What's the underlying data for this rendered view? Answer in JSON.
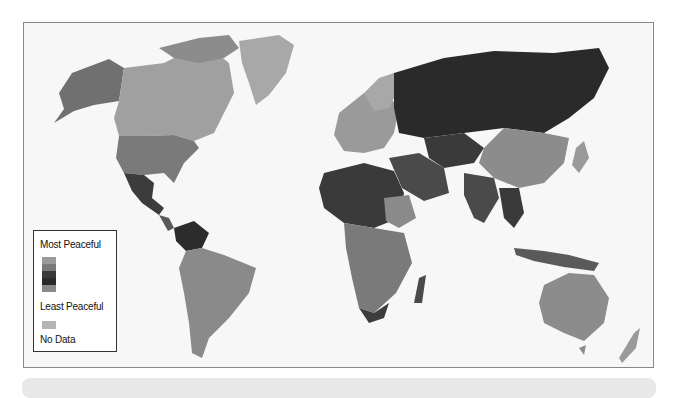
{
  "map": {
    "type": "choropleth-world",
    "legend": {
      "top_label": "Most Peaceful",
      "bottom_label": "Least Peaceful",
      "nodata_label": "No Data",
      "scale_colors": [
        "#9a9a9a",
        "#7a7a7a",
        "#3a3a3a",
        "#2a2a2a",
        "#8a8a8a"
      ],
      "nodata_color": "#b4b4b4"
    },
    "colors": {
      "most_peaceful": "#a8a8a8",
      "peaceful": "#8c8c8c",
      "medium": "#707070",
      "less_peaceful": "#4a4a4a",
      "least_peaceful": "#2c2c2c",
      "ocean": "#f7f7f7",
      "frame_border": "#888888"
    }
  }
}
